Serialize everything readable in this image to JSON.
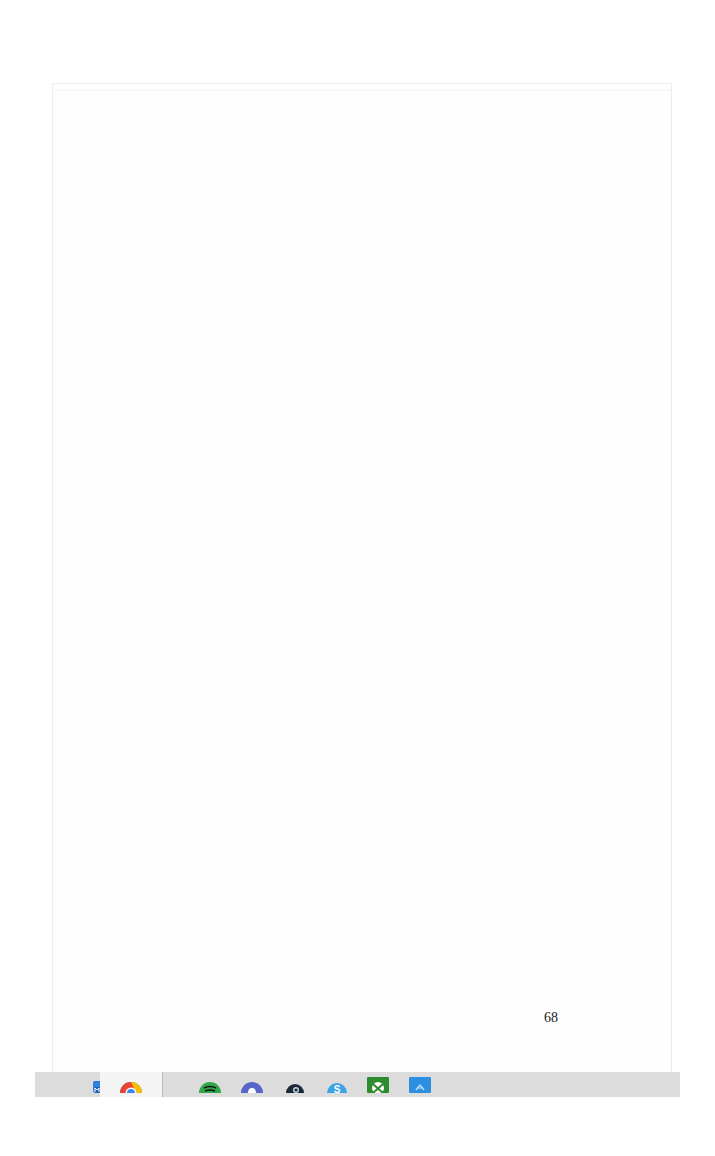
{
  "document": {
    "page_number": "68"
  },
  "taskbar": {
    "items": [
      {
        "name": "partial-app",
        "icon": "partial-app-icon",
        "color": "#2a6fb0"
      },
      {
        "name": "mail",
        "icon": "mail-icon",
        "color": "#2f7fe0"
      },
      {
        "name": "chrome",
        "icon": "chrome-icon",
        "color": "#e8452c",
        "active": true
      },
      {
        "name": "spotify",
        "icon": "spotify-icon",
        "color": "#2fa84a"
      },
      {
        "name": "discord",
        "icon": "discord-icon",
        "color": "#5865c8"
      },
      {
        "name": "steam",
        "icon": "steam-icon",
        "color": "#1b2838"
      },
      {
        "name": "skype",
        "icon": "skype-icon",
        "color": "#3aa3e3"
      },
      {
        "name": "xbox",
        "icon": "xbox-icon",
        "color": "#2e8b2e"
      },
      {
        "name": "app-store",
        "icon": "app-store-icon",
        "color": "#2d8fe0"
      }
    ]
  },
  "colors": {
    "taskbar_bg": "#dcdcdc",
    "page_bg": "#fefefe",
    "page_border": "#ececec"
  }
}
